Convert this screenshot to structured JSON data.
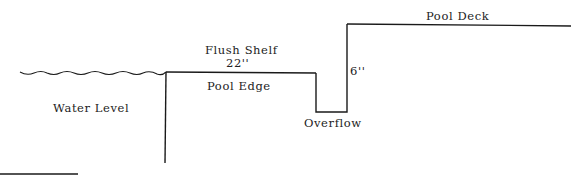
{
  "diagram": {
    "labels": {
      "water_level": "Water Level",
      "flush_shelf": "Flush Shelf",
      "shelf_width": "22''",
      "pool_edge": "Pool Edge",
      "overflow": "Overflow",
      "overflow_depth": "6''",
      "pool_deck": "Pool Deck"
    },
    "colors": {
      "line": "#1a1a1a",
      "text": "#222222",
      "background": "#ffffff"
    }
  }
}
